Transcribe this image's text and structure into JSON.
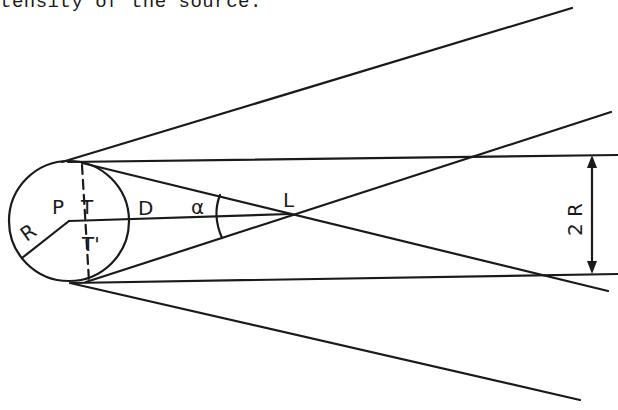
{
  "page": {
    "top_text": "tensity of the source."
  },
  "diagram": {
    "labels": {
      "center": "P",
      "tangent_top": "T",
      "tangent_bottom": "T'",
      "radius": "R",
      "distance": "D",
      "angle": "α",
      "crossing_point": "L",
      "beam_width": "2 R"
    },
    "colors": {
      "line": "#1a1a1a",
      "background": "#ffffff"
    }
  }
}
